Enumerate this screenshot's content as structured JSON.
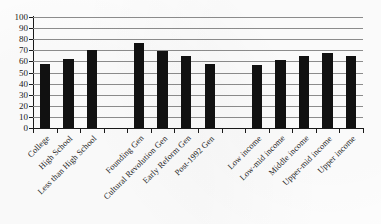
{
  "chart_data": {
    "type": "bar",
    "title": "",
    "subtitle": "",
    "xlabel": "",
    "ylabel": "",
    "ylim": [
      0,
      100
    ],
    "ytick_step": 10,
    "yticks": [
      0,
      10,
      20,
      30,
      40,
      50,
      60,
      70,
      80,
      90,
      100
    ],
    "ytick_labels": [
      "0",
      "10",
      "20",
      "30",
      "40",
      "50",
      "60",
      "70",
      "80",
      "90",
      "100"
    ],
    "grid": true,
    "grid_axis": "y",
    "legend": false,
    "legend_position": "none",
    "bar_color": "#111111",
    "gridline_color": "#8e8e8e",
    "axis_color": "#1a1a1a",
    "categories": [
      "College",
      "High School",
      "Less than High School",
      "",
      "Founding Gen",
      "Cultural Revolution Gen",
      "Early Reform Gen",
      "Post-1992 Gen",
      "",
      "Low income",
      "Low-mid income",
      "Middle income",
      "Upper-mid income",
      "Upper income"
    ],
    "values": [
      58,
      62,
      70,
      null,
      77,
      69,
      65,
      58,
      null,
      57,
      61,
      65,
      68,
      65
    ],
    "groups": [
      {
        "name": "Education",
        "categories": [
          "College",
          "High School",
          "Less than High School"
        ],
        "values": [
          58,
          62,
          70
        ]
      },
      {
        "name": "Generation",
        "categories": [
          "Founding Gen",
          "Cultural Revolution Gen",
          "Early Reform Gen",
          "Post-1992 Gen"
        ],
        "values": [
          77,
          69,
          65,
          58
        ]
      },
      {
        "name": "Income",
        "categories": [
          "Low income",
          "Low-mid income",
          "Middle income",
          "Upper-mid income",
          "Upper income"
        ],
        "values": [
          57,
          61,
          65,
          68,
          65
        ]
      }
    ],
    "annotations": []
  }
}
